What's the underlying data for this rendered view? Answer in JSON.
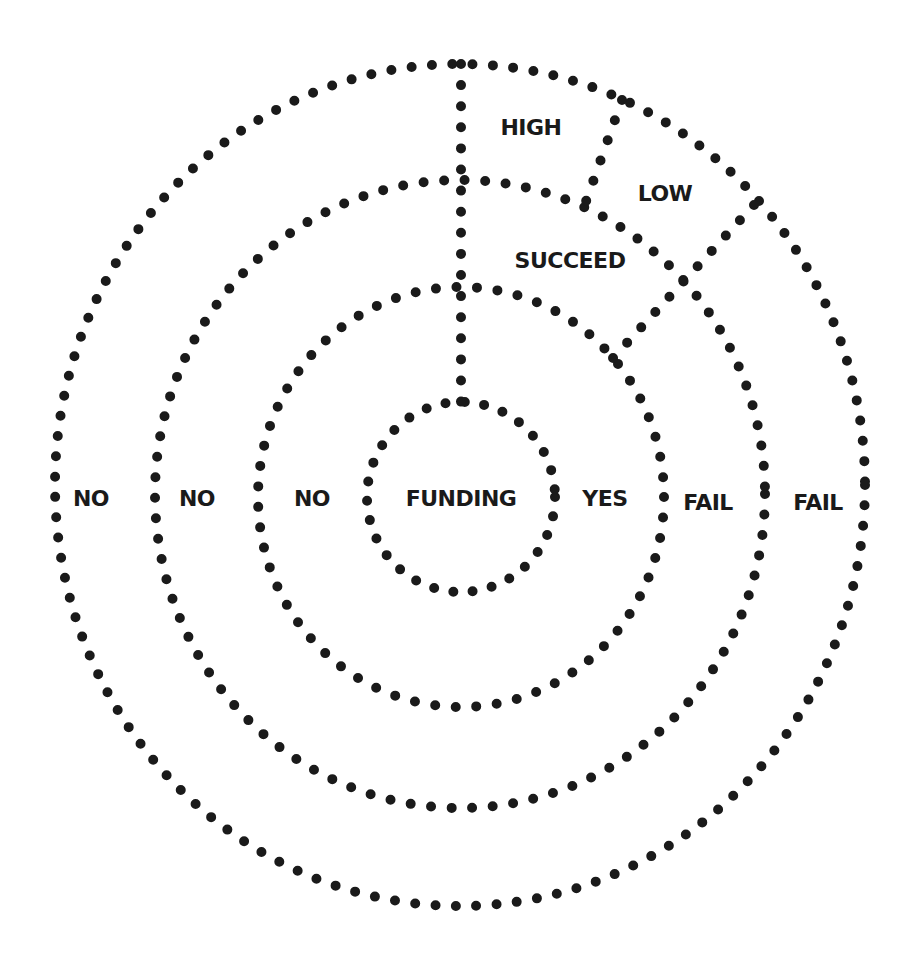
{
  "diagram": {
    "type": "concentric-dotted-decision-rings",
    "colors": {
      "dots": "#1a1a1a",
      "text": "#1a1a1a",
      "background": "#ffffff"
    },
    "center_label": "FUNDING",
    "rings": [
      {
        "level": 1,
        "name": "funding",
        "cx": 461,
        "cy": 497,
        "rx": 94,
        "ry": 95
      },
      {
        "level": 2,
        "name": "funding-outcome",
        "cx": 461,
        "cy": 497,
        "rx": 203,
        "ry": 210
      },
      {
        "level": 3,
        "name": "success",
        "cx": 460,
        "cy": 494,
        "rx": 305,
        "ry": 314
      },
      {
        "level": 4,
        "name": "impact",
        "cx": 460,
        "cy": 485,
        "rx": 405,
        "ry": 421
      }
    ],
    "labels": {
      "funding": "FUNDING",
      "yes": "YES",
      "no_inner": "NO",
      "no_middle": "NO",
      "no_outer": "NO",
      "fail_middle": "FAIL",
      "fail_outer": "FAIL",
      "succeed": "SUCCEED",
      "high": "HIGH",
      "low": "LOW"
    }
  }
}
